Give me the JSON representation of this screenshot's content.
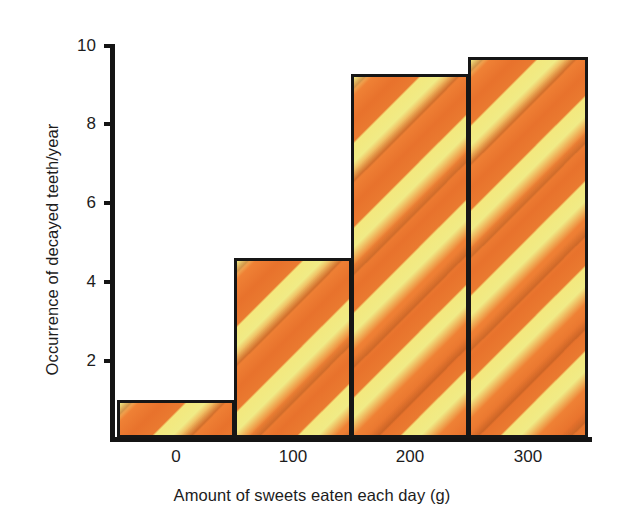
{
  "chart_data": {
    "type": "bar",
    "title": "",
    "subtitle": "",
    "xlabel": "Amount of sweets eaten each day (g)",
    "ylabel": "Occurrence of decayed teeth/year",
    "categories": [
      "0",
      "100",
      "200",
      "300"
    ],
    "bin_edges": [
      -50,
      50,
      150,
      250,
      350
    ],
    "values": [
      1.0,
      4.8,
      9.7,
      10.15
    ],
    "x": [
      0,
      100,
      200,
      300
    ],
    "xlim": [
      -50,
      350
    ],
    "ylim": [
      0,
      10.5
    ],
    "xticks": [
      0,
      100,
      200,
      300
    ],
    "yticks": [
      2,
      4,
      6,
      8,
      10
    ],
    "xticklabels": [
      "0",
      "100",
      "200",
      "300"
    ],
    "yticklabels": [
      "2",
      "4",
      "6",
      "8",
      "10"
    ],
    "grid": false,
    "legend": null,
    "legend_position": "none",
    "annotations": [],
    "style": {
      "bar_fill": "#ee7a33",
      "bar_stripe": "#f0eb86",
      "bar_edge": "#161616",
      "axis_color": "#141414",
      "text_color": "#1c1c1c",
      "background": "#ffffff",
      "hatch": "diagonal-stripes"
    }
  },
  "axes": {
    "y_title": "Occurrence of decayed teeth/year",
    "x_title": "Amount of sweets eaten each day (g)",
    "y_ticks": [
      {
        "label": "10",
        "value": 10
      },
      {
        "label": "8",
        "value": 8
      },
      {
        "label": "6",
        "value": 6
      },
      {
        "label": "4",
        "value": 4
      },
      {
        "label": "2",
        "value": 2
      }
    ],
    "x_ticks": [
      {
        "label": "0"
      },
      {
        "label": "100"
      },
      {
        "label": "200"
      },
      {
        "label": "300"
      }
    ]
  },
  "bars": [
    {
      "label": "0",
      "value": 1.0
    },
    {
      "label": "100",
      "value": 4.8
    },
    {
      "label": "200",
      "value": 9.7
    },
    {
      "label": "300",
      "value": 10.15
    }
  ]
}
